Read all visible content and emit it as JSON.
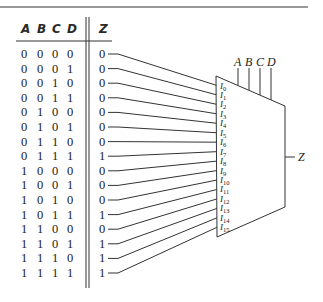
{
  "truth_table": {
    "input_headers": [
      "A",
      "B",
      "C",
      "D"
    ],
    "output_header": "Z",
    "rows": [
      {
        "inputs": [
          "0",
          "0",
          "0",
          "0"
        ],
        "z": "0"
      },
      {
        "inputs": [
          "0",
          "0",
          "0",
          "1"
        ],
        "z": "0"
      },
      {
        "inputs": [
          "0",
          "0",
          "1",
          "0"
        ],
        "z": "0"
      },
      {
        "inputs": [
          "0",
          "0",
          "1",
          "1"
        ],
        "z": "0"
      },
      {
        "inputs": [
          "0",
          "1",
          "0",
          "0"
        ],
        "z": "0"
      },
      {
        "inputs": [
          "0",
          "1",
          "0",
          "1"
        ],
        "z": "0"
      },
      {
        "inputs": [
          "0",
          "1",
          "1",
          "0"
        ],
        "z": "0"
      },
      {
        "inputs": [
          "0",
          "1",
          "1",
          "1"
        ],
        "z": "1"
      },
      {
        "inputs": [
          "1",
          "0",
          "0",
          "0"
        ],
        "z": "0"
      },
      {
        "inputs": [
          "1",
          "0",
          "0",
          "1"
        ],
        "z": "0"
      },
      {
        "inputs": [
          "1",
          "0",
          "1",
          "0"
        ],
        "z": "0"
      },
      {
        "inputs": [
          "1",
          "0",
          "1",
          "1"
        ],
        "z": "1"
      },
      {
        "inputs": [
          "1",
          "1",
          "0",
          "0"
        ],
        "z": "0"
      },
      {
        "inputs": [
          "1",
          "1",
          "0",
          "1"
        ],
        "z": "1"
      },
      {
        "inputs": [
          "1",
          "1",
          "1",
          "0"
        ],
        "z": "1"
      },
      {
        "inputs": [
          "1",
          "1",
          "1",
          "1"
        ],
        "z": "1"
      }
    ]
  },
  "mux": {
    "select_labels": [
      "A",
      "B",
      "C",
      "D"
    ],
    "data_input_prefix": "I",
    "data_input_indices": [
      "0",
      "1",
      "2",
      "3",
      "4",
      "5",
      "6",
      "7",
      "8",
      "9",
      "10",
      "11",
      "12",
      "13",
      "14",
      "15"
    ],
    "output_label": "Z"
  },
  "colors": {
    "line": "#333333",
    "text": "#1a1a1a",
    "background": "#ffffff"
  }
}
